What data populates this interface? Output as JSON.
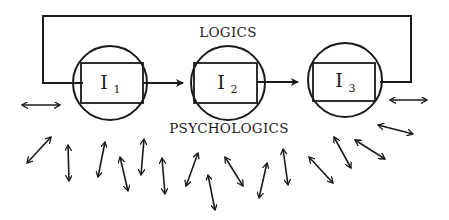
{
  "diagram": {
    "top_label": "LOGICS",
    "bottom_label": "PSYCHOLOGICS",
    "nodes": [
      {
        "id": "I1",
        "letter": "I",
        "subscript": "1",
        "cx": 110,
        "cy": 83
      },
      {
        "id": "I2",
        "letter": "I",
        "subscript": "2",
        "cx": 228,
        "cy": 83
      },
      {
        "id": "I3",
        "letter": "I",
        "subscript": "3",
        "cx": 345,
        "cy": 80
      }
    ],
    "flow": [
      "I1 → I2",
      "I2 → I3",
      "I3 → feedback loop → I1"
    ],
    "colors": {
      "ink": "#1a1a1a",
      "background": "#ffffff"
    },
    "double_arrows": [
      [
        22,
        105,
        60,
        105
      ],
      [
        390,
        100,
        427,
        100
      ],
      [
        51,
        137,
        27,
        163
      ],
      [
        68,
        145,
        69,
        181
      ],
      [
        105,
        142,
        98,
        177
      ],
      [
        120,
        157,
        128,
        191
      ],
      [
        144,
        139,
        141,
        175
      ],
      [
        162,
        158,
        165,
        194
      ],
      [
        198,
        153,
        186,
        186
      ],
      [
        208,
        175,
        215,
        210
      ],
      [
        225,
        157,
        243,
        186
      ],
      [
        267,
        163,
        259,
        198
      ],
      [
        283,
        149,
        288,
        185
      ],
      [
        309,
        157,
        333,
        183
      ],
      [
        334,
        137,
        351,
        168
      ],
      [
        355,
        140,
        385,
        159
      ],
      [
        378,
        125,
        413,
        134
      ]
    ]
  }
}
